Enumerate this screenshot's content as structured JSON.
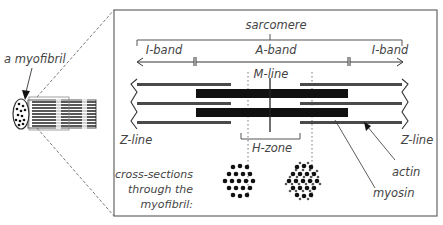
{
  "diagram": {
    "myofibril_label": "a myofibril",
    "sarcomere_label": "sarcomere",
    "i_band_left_label": "I-band",
    "a_band_label": "A-band",
    "i_band_right_label": "I-band",
    "m_line_label": "M-line",
    "z_line_left_label": "Z-line",
    "z_line_right_label": "Z-line",
    "h_zone_label": "H-zone",
    "actin_label": "actin",
    "myosin_label": "myosin",
    "cross_sections_label": [
      "cross-sections",
      "through the",
      "myofibril:"
    ]
  },
  "colors": {
    "thin_filament": "#4a4a4a",
    "thick_filament": "#111111",
    "frame": "#666666",
    "text": "#444444"
  }
}
